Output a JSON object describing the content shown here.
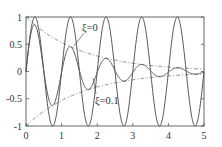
{
  "chart_data": {
    "type": "line",
    "title": "",
    "xlabel": "",
    "ylabel": "",
    "xlim": [
      0,
      5
    ],
    "ylim": [
      -1,
      1
    ],
    "grid": false,
    "legend": "none (inline annotations)",
    "x_ticks": [
      "0",
      "1",
      "2",
      "3",
      "4",
      "5"
    ],
    "y_ticks": [
      "-1",
      "-0.5",
      "0",
      "0.5",
      "1"
    ],
    "series": [
      {
        "name": "ξ=0",
        "style": "solid",
        "formula": "sin(2πt)",
        "x": [
          0,
          0.25,
          0.5,
          0.75,
          1.0,
          1.25,
          1.5,
          1.75,
          2.0,
          2.25,
          2.5,
          2.75,
          3.0,
          3.25,
          3.5,
          3.75,
          4.0,
          4.25,
          4.5,
          4.75,
          5.0
        ],
        "values": [
          0,
          1,
          0,
          -1,
          0,
          1,
          0,
          -1,
          0,
          1,
          0,
          -1,
          0,
          1,
          0,
          -1,
          0,
          1,
          0,
          -1,
          0
        ]
      },
      {
        "name": "ξ=0.1",
        "style": "solid",
        "formula": "exp(-0.1·2π·t)·sin(2πt)",
        "x": [
          0,
          0.25,
          0.75,
          1.25,
          1.75,
          2.25,
          2.75,
          3.25,
          3.75,
          4.25,
          4.75,
          5.0
        ],
        "values": [
          0,
          0.85,
          -0.62,
          0.45,
          -0.33,
          0.24,
          -0.18,
          0.13,
          -0.09,
          0.07,
          -0.05,
          0
        ]
      },
      {
        "name": "envelope (+)",
        "style": "dash-dot",
        "formula": "exp(-0.1·2π·t)",
        "x": [
          0,
          1,
          2,
          3,
          4,
          5
        ],
        "values": [
          1,
          0.53,
          0.28,
          0.15,
          0.08,
          0.04
        ]
      },
      {
        "name": "envelope (-)",
        "style": "dash-dot",
        "formula": "-exp(-0.1·2π·t)",
        "x": [
          0,
          1,
          2,
          3,
          4,
          5
        ],
        "values": [
          -1,
          -0.53,
          -0.28,
          -0.15,
          -0.08,
          -0.04
        ]
      }
    ],
    "annotations": [
      {
        "text": "ξ=0",
        "x": 1.8,
        "y": 0.75
      },
      {
        "text": "ξ=0.1",
        "x": 2.3,
        "y": -0.55
      }
    ]
  },
  "labels": {
    "xi0": "ξ=0",
    "xi01": "ξ=0.1",
    "x_ticks": [
      "0",
      "1",
      "2",
      "3",
      "4",
      "5"
    ],
    "y_ticks": [
      "1",
      "0.5",
      "0",
      "-0.5",
      "-1"
    ]
  }
}
